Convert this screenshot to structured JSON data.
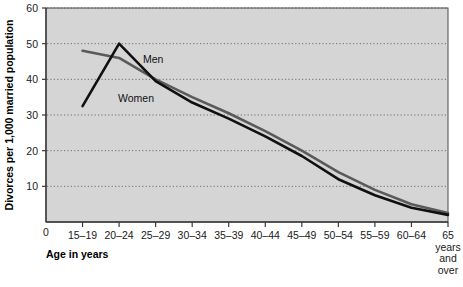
{
  "chart_data": {
    "type": "line",
    "title": "",
    "xlabel": "Age in years",
    "ylabel": "Divorces per 1,000 married population",
    "categories": [
      "15–19",
      "20–24",
      "25–29",
      "30–34",
      "35–39",
      "40–44",
      "45–49",
      "50–54",
      "55–59",
      "60–64",
      "65 years and over"
    ],
    "xtick_labels": [
      "15–19",
      "20–24",
      "25–29",
      "30–34",
      "35–39",
      "40–44",
      "45–49",
      "50–54",
      "55–59",
      "60–64",
      "65"
    ],
    "xtick_extra": [
      "years",
      "and",
      "over"
    ],
    "x_origin_label": "0",
    "ytick_labels": [
      "0",
      "10",
      "20",
      "30",
      "40",
      "50",
      "60"
    ],
    "yticks": [
      0,
      10,
      20,
      30,
      40,
      50,
      60
    ],
    "ylim": [
      0,
      60
    ],
    "grid": true,
    "grid_style": "dotted-horizontal",
    "legend": "inline-labels",
    "plot_background": "#d5d5d5",
    "series": [
      {
        "name": "Men",
        "color": "#5a5a5a",
        "label_x_category": "25–29",
        "values": [
          48,
          46,
          40,
          35,
          30.5,
          25.5,
          20,
          14,
          9,
          5,
          2.5
        ]
      },
      {
        "name": "Women",
        "color": "#101010",
        "label_x_category": "25–29",
        "values": [
          32.5,
          50,
          39.5,
          33.5,
          29,
          24,
          18.5,
          12,
          7.5,
          4,
          2
        ]
      }
    ]
  },
  "axis": {
    "y_label": "Divorces per 1,000 married population",
    "x_label": "Age in years"
  }
}
